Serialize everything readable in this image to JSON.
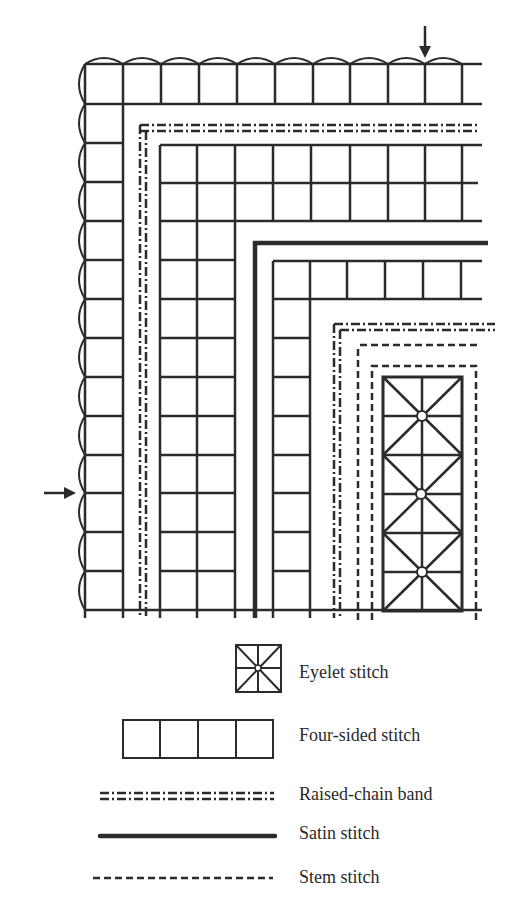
{
  "figure": {
    "type": "embroidery-corner-diagram",
    "ink_color": "#2b2b2b",
    "background": "#ffffff",
    "markers": [
      {
        "name": "top-arrow",
        "direction": "down"
      },
      {
        "name": "left-arrow",
        "direction": "right"
      }
    ]
  },
  "legend": {
    "items": [
      {
        "key": "eyelet",
        "label": "Eyelet stitch"
      },
      {
        "key": "four-sided",
        "label": "Four-sided stitch"
      },
      {
        "key": "raised-chain",
        "label": "Raised-chain band"
      },
      {
        "key": "satin",
        "label": "Satin stitch"
      },
      {
        "key": "stem",
        "label": "Stem stitch"
      }
    ]
  }
}
